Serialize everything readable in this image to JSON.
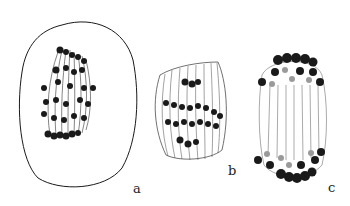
{
  "figure": {
    "panels": [
      {
        "id": "a",
        "label": "a",
        "description": "Cell with spindle and scattered chromosomes"
      },
      {
        "id": "b",
        "label": "b",
        "description": "Spindle with chromosomes at metaphase plate"
      },
      {
        "id": "c",
        "label": "c",
        "description": "Spindle with chromosomes at both poles"
      }
    ],
    "colors": {
      "ink": "#1a1a1a",
      "background": "#ffffff",
      "light_chromosome": "#9a9a9a"
    }
  }
}
